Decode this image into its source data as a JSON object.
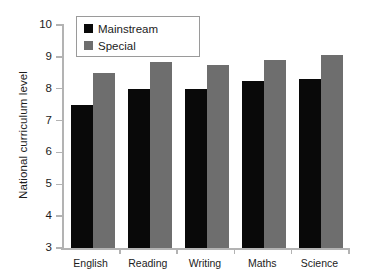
{
  "chart_data": {
    "type": "bar",
    "title": "",
    "xlabel": "",
    "ylabel": "National curriculum level",
    "categories": [
      "English",
      "Reading",
      "Writing",
      "Maths",
      "Science"
    ],
    "series": [
      {
        "name": "Mainstream",
        "color": "#090909",
        "values": [
          7.5,
          8.0,
          8.0,
          8.25,
          8.3
        ]
      },
      {
        "name": "Special",
        "color": "#6e6e6e",
        "values": [
          8.5,
          8.85,
          8.75,
          8.9,
          9.05
        ]
      }
    ],
    "ylim": [
      3,
      10
    ],
    "yticks": [
      3,
      4,
      5,
      6,
      7,
      8,
      9,
      10
    ],
    "ytick_labels": [
      "3",
      "4",
      "5",
      "6",
      "7",
      "8",
      "9",
      "10"
    ],
    "grid": false,
    "legend_position": "top-left",
    "background": "#ffffff",
    "axis_color": "#b3b3b3"
  }
}
